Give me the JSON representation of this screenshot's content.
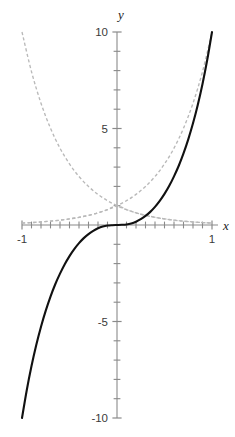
{
  "chart_data": {
    "type": "line",
    "title": "",
    "subtitle": "",
    "xlabel": "x",
    "ylabel": "y",
    "xlim": [
      -1,
      1
    ],
    "ylim": [
      -10,
      10
    ],
    "grid": false,
    "legend": "none",
    "axes_style": "centered-cross",
    "x_tick_labels": [
      "-1",
      "1"
    ],
    "x_tick_label_values": [
      -1,
      1
    ],
    "y_tick_labels": [
      "10",
      "5",
      "-5",
      "-10"
    ],
    "y_tick_label_values": [
      10,
      5,
      -5,
      -10
    ],
    "x_minor_ticks": [
      -0.9,
      -0.8,
      -0.7,
      -0.6,
      -0.5,
      -0.4,
      -0.3,
      -0.2,
      -0.1,
      0.1,
      0.2,
      0.3,
      0.4,
      0.5,
      0.6,
      0.7,
      0.8,
      0.9
    ],
    "y_minor_ticks": [
      9,
      8,
      7,
      6,
      4,
      3,
      2,
      1,
      -1,
      -2,
      -3,
      -4,
      -6,
      -7,
      -8,
      -9
    ],
    "series": [
      {
        "name": "solid-odd-curve",
        "style": "solid",
        "color": "#111111",
        "x": [
          -1.0,
          -0.95,
          -0.9,
          -0.85,
          -0.8,
          -0.75,
          -0.7,
          -0.65,
          -0.6,
          -0.55,
          -0.5,
          -0.45,
          -0.4,
          -0.35,
          -0.3,
          -0.25,
          -0.2,
          -0.15,
          -0.1,
          -0.05,
          0.0,
          0.05,
          0.1,
          0.15,
          0.2,
          0.25,
          0.3,
          0.35,
          0.4,
          0.45,
          0.5,
          0.55,
          0.6,
          0.65,
          0.7,
          0.75,
          0.8,
          0.85,
          0.9,
          0.95,
          1.0
        ],
        "y": [
          -10.0,
          -8.56,
          -7.31,
          -6.22,
          -5.27,
          -4.44,
          -3.71,
          -3.07,
          -2.52,
          -2.03,
          -1.61,
          -1.25,
          -0.94,
          -0.68,
          -0.47,
          -0.3,
          -0.17,
          -0.08,
          -0.03,
          -0.01,
          0.0,
          0.01,
          0.03,
          0.08,
          0.17,
          0.3,
          0.47,
          0.68,
          0.94,
          1.25,
          1.61,
          2.03,
          2.52,
          3.07,
          3.71,
          4.44,
          5.27,
          6.22,
          7.31,
          8.56,
          10.0
        ]
      },
      {
        "name": "dashed-growth-curve",
        "style": "dashed",
        "color": "#b9b9b9",
        "x": [
          -1.0,
          -0.9,
          -0.8,
          -0.7,
          -0.6,
          -0.5,
          -0.4,
          -0.3,
          -0.2,
          -0.1,
          0.0,
          0.1,
          0.2,
          0.3,
          0.4,
          0.5,
          0.6,
          0.7,
          0.8,
          0.9,
          1.0
        ],
        "y": [
          0.1,
          0.126,
          0.158,
          0.2,
          0.251,
          0.316,
          0.398,
          0.501,
          0.631,
          0.794,
          1.0,
          1.259,
          1.585,
          1.995,
          2.512,
          3.162,
          3.981,
          5.012,
          6.31,
          7.943,
          10.0
        ]
      },
      {
        "name": "dashed-decay-curve",
        "style": "dashed",
        "color": "#b9b9b9",
        "x": [
          -1.0,
          -0.9,
          -0.8,
          -0.7,
          -0.6,
          -0.5,
          -0.4,
          -0.3,
          -0.2,
          -0.1,
          0.0,
          0.1,
          0.2,
          0.3,
          0.4,
          0.5,
          0.6,
          0.7,
          0.8,
          0.9,
          1.0
        ],
        "y": [
          10.0,
          7.943,
          6.31,
          5.012,
          3.981,
          3.162,
          2.512,
          1.995,
          1.585,
          1.259,
          1.0,
          0.794,
          0.631,
          0.501,
          0.398,
          0.316,
          0.251,
          0.2,
          0.158,
          0.126,
          0.1
        ]
      },
      {
        "name": "dashed-shallow-rising-curve",
        "style": "dashed",
        "color": "#b9b9b9",
        "x": [
          -1.0,
          -0.9,
          -0.8,
          -0.7,
          -0.6,
          -0.5,
          -0.4,
          -0.3,
          -0.2,
          -0.1,
          0.0,
          0.1,
          0.2,
          0.3,
          0.4,
          0.5,
          0.6,
          0.7,
          0.8,
          0.9,
          1.0
        ],
        "y": [
          0.1,
          0.126,
          0.158,
          0.2,
          0.251,
          0.316,
          0.398,
          0.501,
          0.631,
          0.794,
          1.0,
          0.794,
          0.631,
          0.501,
          0.398,
          0.316,
          0.251,
          0.2,
          0.158,
          0.126,
          0.1
        ]
      }
    ],
    "annotations": []
  },
  "axis": {
    "x_label": "x",
    "y_label": "y"
  },
  "labels": {
    "x_min": "-1",
    "x_max": "1",
    "y_max": "10",
    "y_mid_pos": "5",
    "y_mid_neg": "-5",
    "y_min": "-10"
  },
  "colors": {
    "solid_curve": "#111111",
    "dashed_curve": "#b9b9b9",
    "axis": "#8a8a8a",
    "text": "#3a3a3a",
    "background": "#ffffff"
  }
}
